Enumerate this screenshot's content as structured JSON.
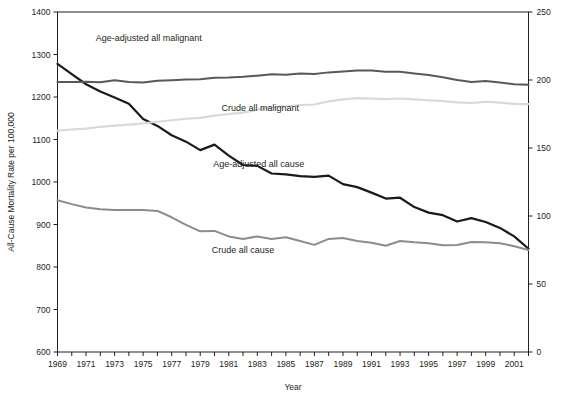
{
  "chart_data": {
    "type": "line",
    "title": "",
    "xlabel": "Year",
    "ylabel": "All-Cause Mortality Rate per 100,000",
    "ylabel_right": "",
    "grid": false,
    "legend": "inline-labels",
    "xlim": [
      1969,
      2002
    ],
    "ylim": [
      600,
      1400
    ],
    "ylim_right": [
      0,
      250
    ],
    "y_ticks": [
      600,
      700,
      800,
      900,
      1000,
      1100,
      1200,
      1300,
      1400
    ],
    "y_ticks_right": [
      0,
      50,
      100,
      150,
      200,
      250
    ],
    "x_tick_labels": [
      "1969",
      "1971",
      "1973",
      "1975",
      "1977",
      "1979",
      "1981",
      "1983",
      "1985",
      "1987",
      "1989",
      "1991",
      "1993",
      "1995",
      "1997",
      "1999",
      "2001"
    ],
    "x_minor_ticks": [
      1969,
      1970,
      1971,
      1972,
      1973,
      1974,
      1975,
      1976,
      1977,
      1978,
      1979,
      1980,
      1981,
      1982,
      1983,
      1984,
      1985,
      1986,
      1987,
      1988,
      1989,
      1990,
      1991,
      1992,
      1993,
      1994,
      1995,
      1996,
      1997,
      1998,
      1999,
      2000,
      2001,
      2002
    ],
    "x": [
      1969,
      1970,
      1971,
      1972,
      1973,
      1974,
      1975,
      1976,
      1977,
      1978,
      1979,
      1980,
      1981,
      1982,
      1983,
      1984,
      1985,
      1986,
      1987,
      1988,
      1989,
      1990,
      1991,
      1992,
      1993,
      1994,
      1995,
      1996,
      1997,
      1998,
      1999,
      2000,
      2001,
      2002
    ],
    "series": [
      {
        "name": "Age-adjusted all cause",
        "axis": "left",
        "color": "#1a1a1a",
        "width": 2.2,
        "label_x": 1983.1,
        "label_y": 1035,
        "values": [
          1278,
          1254,
          1230,
          1213,
          1199,
          1184,
          1148,
          1132,
          1110,
          1095,
          1075,
          1088,
          1062,
          1040,
          1038,
          1020,
          1018,
          1014,
          1012,
          1015,
          995,
          988,
          975,
          961,
          963,
          941,
          928,
          922,
          907,
          915,
          906,
          892,
          872,
          843
        ]
      },
      {
        "name": "Crude all cause",
        "axis": "left",
        "color": "#8c8c8c",
        "width": 2.0,
        "label_x": 1982.0,
        "label_y": 834,
        "values": [
          957,
          948,
          940,
          936,
          934,
          934,
          934,
          932,
          917,
          899,
          884,
          885,
          872,
          866,
          872,
          866,
          870,
          861,
          852,
          866,
          868,
          861,
          857,
          850,
          861,
          858,
          856,
          851,
          852,
          859,
          858,
          856,
          849,
          840
        ]
      },
      {
        "name": "Age-adjusted all malignant",
        "axis": "right",
        "color": "#595959",
        "width": 2.0,
        "label_x": 1975.4,
        "label_y": 1331,
        "values": [
          198.5,
          198.5,
          198.7,
          198.4,
          199.8,
          198.6,
          198.2,
          199.4,
          199.8,
          200.3,
          200.6,
          201.7,
          201.8,
          202.3,
          203.2,
          204.2,
          203.9,
          204.7,
          204.4,
          205.6,
          206.3,
          207.0,
          207.0,
          206.0,
          206.1,
          204.8,
          203.7,
          202.0,
          200.0,
          198.6,
          199.2,
          198.2,
          196.8,
          196.5
        ]
      },
      {
        "name": "Crude all malignant",
        "axis": "right",
        "color": "#d9d9d9",
        "width": 2.2,
        "label_x": 1983.2,
        "label_y": 1168,
        "values": [
          162.8,
          163.6,
          164.3,
          165.6,
          166.5,
          167.2,
          168.1,
          169.3,
          170.4,
          171.5,
          172.2,
          173.8,
          175.0,
          176.0,
          178.1,
          180.0,
          180.6,
          181.6,
          182.0,
          184.3,
          185.8,
          186.6,
          186.3,
          186.0,
          186.4,
          185.7,
          185.1,
          184.5,
          183.6,
          183.1,
          184.0,
          183.4,
          182.4,
          182.3
        ]
      }
    ]
  },
  "plot": {
    "frame_color": "#231f20",
    "background": "#ffffff"
  }
}
